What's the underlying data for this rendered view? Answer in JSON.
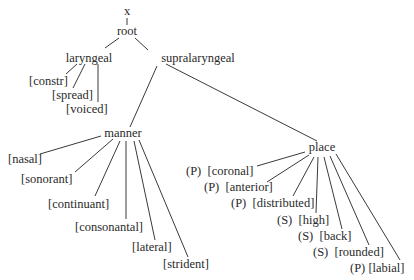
{
  "diagram": {
    "type": "feature-geometry-tree",
    "nodes": {
      "x": "x",
      "root": "root",
      "laryngeal": "laryngeal",
      "supralaryngeal": "supralaryngeal",
      "manner": "manner",
      "place": "place"
    },
    "laryngeal_features": [
      "[constr]",
      "[spread]",
      "[voiced]"
    ],
    "manner_features": [
      "[nasal]",
      "[sonorant]",
      "[continuant]",
      "[consonantal]",
      "[lateral]",
      "[strident]"
    ],
    "place_features": [
      {
        "marker": "(P)",
        "label": "[coronal]"
      },
      {
        "marker": "(P)",
        "label": "[anterior]"
      },
      {
        "marker": "(P)",
        "label": "[distributed]"
      },
      {
        "marker": "(S)",
        "label": "[high]"
      },
      {
        "marker": "(S)",
        "label": "[back]"
      },
      {
        "marker": "(S)",
        "label": "[rounded]"
      },
      {
        "marker": "(P)",
        "label": "[labial]"
      }
    ]
  }
}
